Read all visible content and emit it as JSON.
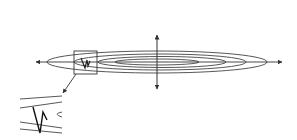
{
  "diagram": {
    "description": "Elongated elliptical contour lines with horizontal and vertical axes; a boxed region near the left end is magnified in an inset showing a zigzag path",
    "colors": {
      "stroke": "#333333",
      "background": "#ffffff"
    },
    "axes": {
      "horizontal": {
        "x1": 35,
        "x2": 283,
        "y": 62,
        "arrows": "both"
      },
      "vertical": {
        "x": 157,
        "y1": 34,
        "y2": 90,
        "arrows": "both"
      }
    },
    "contours": [
      {
        "cx": 157,
        "cy": 62,
        "rx": 110,
        "ry": 11
      },
      {
        "cx": 157,
        "cy": 62,
        "rx": 86,
        "ry": 8
      },
      {
        "cx": 157,
        "cy": 62,
        "rx": 64,
        "ry": 5.5
      },
      {
        "cx": 157,
        "cy": 62,
        "rx": 42,
        "ry": 3
      }
    ],
    "zoom_box": {
      "x": 74,
      "y": 51,
      "width": 23,
      "height": 23
    },
    "inset_pointer": {
      "x1": 76,
      "y1": 74,
      "x2": 63,
      "y2": 93
    },
    "inset_label": "magnified region"
  }
}
